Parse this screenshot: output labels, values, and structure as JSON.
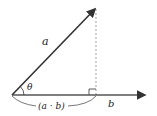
{
  "diagram": {
    "type": "vector-projection",
    "labels": {
      "vector_a": "a",
      "vector_b": "b",
      "angle": "θ",
      "projection": "(a · b)"
    },
    "colors": {
      "stroke": "#333333",
      "dashed": "#888888",
      "text": "#222222"
    }
  }
}
